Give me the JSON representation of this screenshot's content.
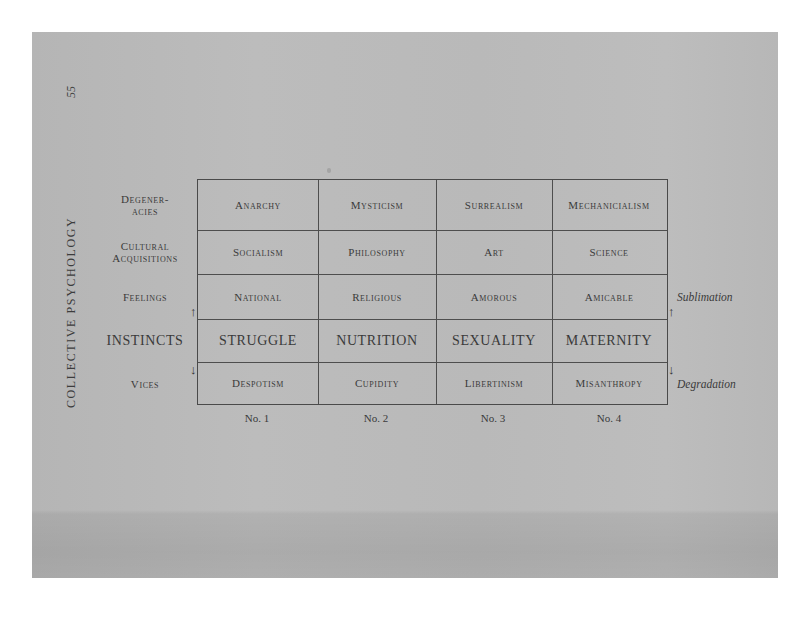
{
  "page": {
    "running_head": "COLLECTIVE PSYCHOLOGY",
    "page_number": "55"
  },
  "table": {
    "row_labels": [
      {
        "line1": "Degener-",
        "line2": "acies"
      },
      {
        "line1": "Cultural",
        "line2": "Acquisitions"
      },
      {
        "line1": "Feelings",
        "line2": ""
      },
      {
        "line1": "INSTINCTS",
        "line2": ""
      },
      {
        "line1": "Vices",
        "line2": ""
      }
    ],
    "rows": [
      [
        "Anarchy",
        "Mysticism",
        "Surrealism",
        "Mechanicialism"
      ],
      [
        "Socialism",
        "Philosophy",
        "Art",
        "Science"
      ],
      [
        "National",
        "Religious",
        "Amorous",
        "Amicable"
      ],
      [
        "STRUGGLE",
        "NUTRITION",
        "SEXUALITY",
        "MATERNITY"
      ],
      [
        "Despotism",
        "Cupidity",
        "Libertinism",
        "Misanthropy"
      ]
    ],
    "column_numbers": [
      "No. 1",
      "No. 2",
      "No. 3",
      "No. 4"
    ],
    "right_labels": {
      "up": "Sublimation",
      "down": "Degradation"
    },
    "arrows": {
      "up": "↑",
      "down": "↓"
    }
  },
  "colors": {
    "page_background": "#b9b9b9",
    "ink": "#3a3a3a",
    "outer_background": "#ffffff"
  }
}
